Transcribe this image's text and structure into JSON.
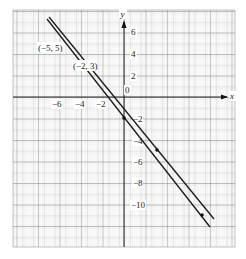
{
  "graph": {
    "axes": {
      "x_label": "x",
      "y_label": "y",
      "origin_label": "0"
    },
    "x_ticks": [
      {
        "value": -6,
        "label": "−6"
      },
      {
        "value": -4,
        "label": "−4"
      },
      {
        "value": -2,
        "label": "−2"
      }
    ],
    "y_ticks": [
      {
        "value": 6,
        "label": "6"
      },
      {
        "value": 4,
        "label": "4"
      },
      {
        "value": 2,
        "label": "2"
      },
      {
        "value": -2,
        "label": "−2"
      },
      {
        "value": -4,
        "label": "−4"
      },
      {
        "value": -6,
        "label": "−6"
      },
      {
        "value": -8,
        "label": "−8"
      },
      {
        "value": -10,
        "label": "−10"
      }
    ],
    "point_labels": [
      {
        "label": "(−5, 5)"
      },
      {
        "label": "(−2, 3)"
      }
    ],
    "line_color": "#1a1a1a",
    "grid_color": "#9a9a9a"
  }
}
